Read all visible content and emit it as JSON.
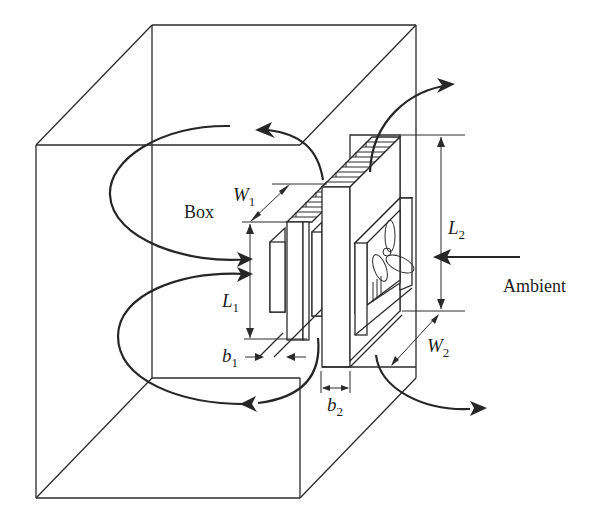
{
  "figure": {
    "labels": {
      "box": "Box",
      "ambient": "Ambient",
      "w1": {
        "symbol": "W",
        "subscript": "1"
      },
      "l1": {
        "symbol": "L",
        "subscript": "1"
      },
      "b1": {
        "symbol": "b",
        "subscript": "1"
      },
      "w2": {
        "symbol": "W",
        "subscript": "2"
      },
      "l2": {
        "symbol": "L",
        "subscript": "2"
      },
      "b2": {
        "symbol": "b",
        "subscript": "2"
      }
    },
    "colors": {
      "line": "#2b2b2b",
      "background": "#ffffff"
    }
  }
}
